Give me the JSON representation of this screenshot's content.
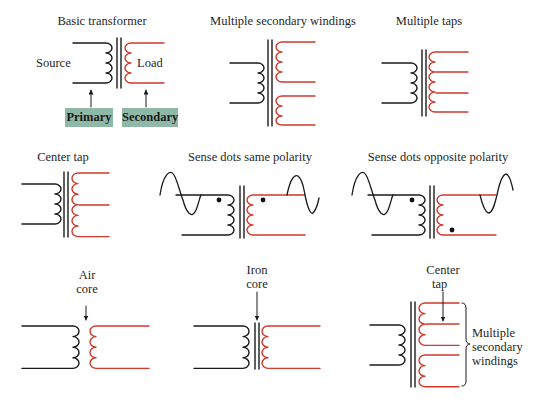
{
  "colors": {
    "primary_wire": "#1a1a1a",
    "secondary_wire": "#d0392b",
    "label_box": "#8fb8a6",
    "text": "#1f1f1f"
  },
  "panels": [
    {
      "id": "basic-transformer",
      "title": "Basic transformer",
      "labels": {
        "source": "Source",
        "load": "Load"
      },
      "boxes": {
        "primary": "Primary",
        "secondary": "Secondary"
      }
    },
    {
      "id": "multiple-secondary-windings",
      "title": "Multiple secondary windings"
    },
    {
      "id": "multiple-taps",
      "title": "Multiple taps"
    },
    {
      "id": "center-tap",
      "title": "Center tap"
    },
    {
      "id": "sense-dots-same",
      "title": "Sense dots same polarity"
    },
    {
      "id": "sense-dots-opposite",
      "title": "Sense dots opposite polarity"
    },
    {
      "id": "air-core",
      "annotation_line1": "Air",
      "annotation_line2": "core"
    },
    {
      "id": "iron-core",
      "annotation_line1": "Iron",
      "annotation_line2": "core"
    },
    {
      "id": "center-tap-multiple-secondary",
      "annotation_line1": "Center",
      "annotation_line2": "tap",
      "brace_label_line1": "Multiple",
      "brace_label_line2": "secondary",
      "brace_label_line3": "windings"
    }
  ]
}
